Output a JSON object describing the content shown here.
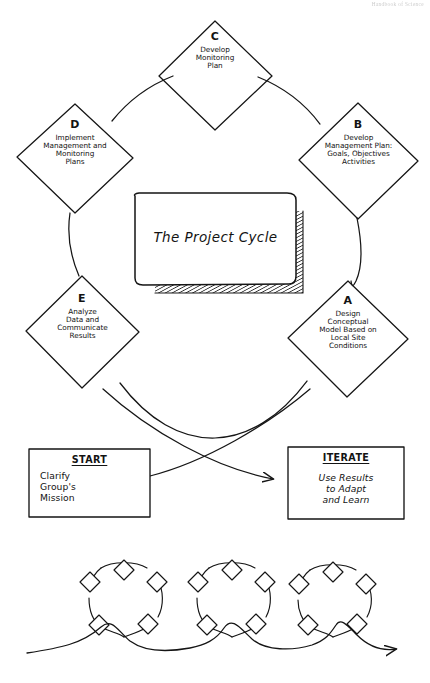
{
  "page": {
    "header_text": "Handbook of Science",
    "background": "#ffffff",
    "ink": "#151515"
  },
  "center_card": {
    "title": "The Project Cycle"
  },
  "cycle": {
    "nodes": [
      {
        "letter": "C",
        "text": "Develop\nMonitoring\nPlan",
        "cx": 215,
        "cy": 75,
        "rx": 57,
        "ry": 55
      },
      {
        "letter": "B",
        "text": "Develop\nManagement Plan:\nGoals, Objectives\nActivities",
        "cx": 358,
        "cy": 160,
        "rx": 60,
        "ry": 58
      },
      {
        "letter": "A",
        "text": "Design\nConceptual\nModel Based on\nLocal Site\nConditions",
        "cx": 348,
        "cy": 338,
        "rx": 60,
        "ry": 58
      },
      {
        "letter": "E",
        "text": "Analyze\nData and\nCommunicate\nResults",
        "cx": 82,
        "cy": 331,
        "rx": 57,
        "ry": 56
      },
      {
        "letter": "D",
        "text": "Implement\nManagement and\nMonitoring\nPlans",
        "cx": 75,
        "cy": 158,
        "rx": 58,
        "ry": 55
      }
    ]
  },
  "start_box": {
    "heading": "START",
    "body": "Clarify\nGroup's\nMission"
  },
  "iterate_box": {
    "heading": "ITERATE",
    "body": "Use Results\nto Adapt\nand Learn"
  },
  "footer_motif": {
    "loop_count": 3,
    "diamonds_per_loop": 5,
    "description": "repeating-cycles-arrow"
  }
}
